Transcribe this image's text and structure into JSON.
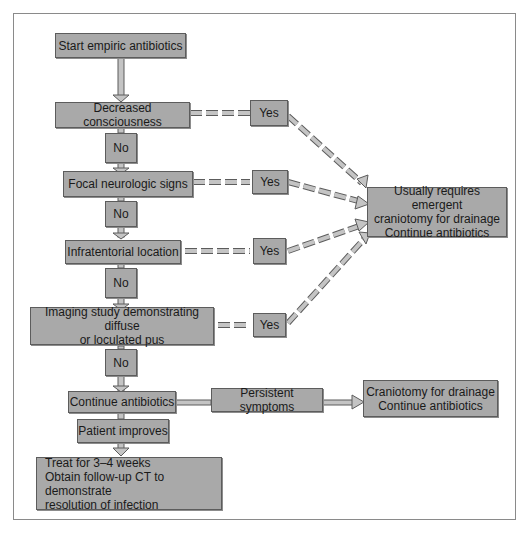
{
  "diagram": {
    "start": "Start empiric antibiotics",
    "decisions": [
      {
        "label": "Decreased consciousness",
        "no": "No",
        "yes": "Yes"
      },
      {
        "label": "Focal neurologic signs",
        "no": "No",
        "yes": "Yes"
      },
      {
        "label": "Infratentorial location",
        "no": "No",
        "yes": "Yes"
      },
      {
        "label": "Imaging study demonstrating diffuse\nor loculated pus",
        "no": "No",
        "yes": "Yes"
      }
    ],
    "emergent_outcome": "Usually requires emergent\ncraniotomy for drainage\nContinue antibiotics",
    "continue": "Continue antibiotics",
    "persistent": "Persistent symptoms",
    "craniotomy": "Craniotomy for drainage\nContinue antibiotics",
    "improves": "Patient improves",
    "treat": "Treat for 3–4 weeks\nObtain follow-up CT to demonstrate\n  resolution of infection"
  },
  "colors": {
    "box_fill": "#a9a9a9",
    "box_border": "#5c5c5c",
    "arrow_fill": "#c4c4c4",
    "frame_border": "#8a8a8a"
  }
}
